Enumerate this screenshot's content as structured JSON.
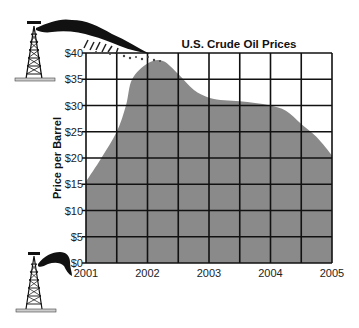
{
  "chart_data": {
    "type": "area",
    "title": "U.S. Crude Oil Prices",
    "xlabel": "",
    "ylabel": "Price per Barrel",
    "x_ticks": [
      "2001",
      "2002",
      "2003",
      "2004",
      "2005"
    ],
    "y_ticks": [
      "$0",
      "$5",
      "$10",
      "$15",
      "$20",
      "$25",
      "$30",
      "$35",
      "$40"
    ],
    "xlim": [
      2001,
      2005
    ],
    "ylim": [
      0,
      40
    ],
    "grid": true,
    "legend": null,
    "series": [
      {
        "name": "U.S. Crude Oil Price",
        "x": [
          2001.0,
          2001.25,
          2001.5,
          2001.65,
          2001.75,
          2002.0,
          2002.25,
          2002.5,
          2002.75,
          2003.0,
          2003.25,
          2003.5,
          2003.75,
          2004.0,
          2004.25,
          2004.5,
          2004.75,
          2005.0
        ],
        "values": [
          15.5,
          20,
          25,
          30,
          35,
          38,
          38.5,
          36,
          33,
          31.5,
          31,
          30.8,
          30.5,
          30,
          29,
          26.5,
          24,
          20.5
        ]
      }
    ],
    "fill_color": "#8a8a8a",
    "grid_color": "#111111",
    "decorations": [
      "oil-derrick-gushing-top-left",
      "oil-derrick-small-bottom-left"
    ]
  }
}
